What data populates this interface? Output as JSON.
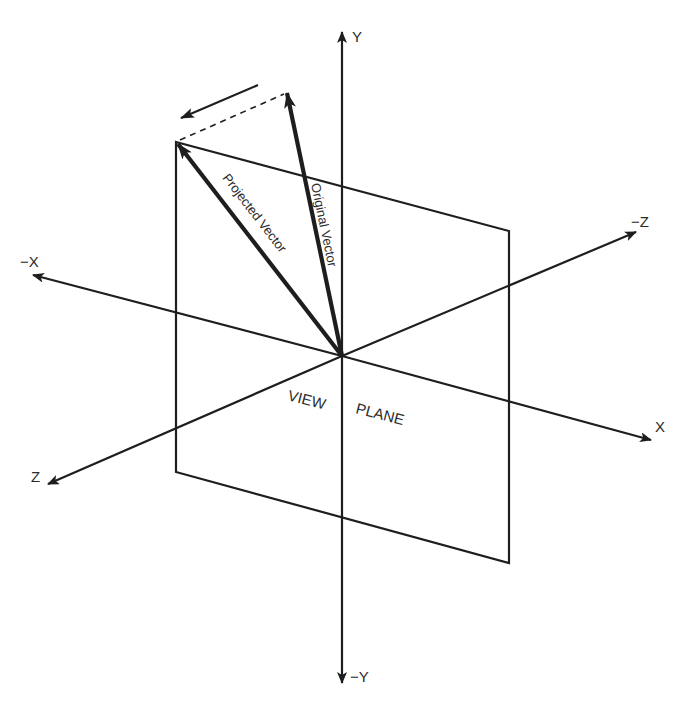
{
  "diagram": {
    "title": "",
    "colors": {
      "line": "#1e1e1e",
      "text": "#2b2b2b",
      "background": "#ffffff"
    },
    "axes": {
      "y_pos": {
        "label": "Y"
      },
      "y_neg": {
        "label": "−Y"
      },
      "x_pos": {
        "label": "X"
      },
      "x_neg": {
        "label": "−X"
      },
      "z_pos": {
        "label": "Z"
      },
      "z_neg": {
        "label": "−Z"
      }
    },
    "vectors": {
      "original": {
        "label": "Original Vector"
      },
      "projected": {
        "label": "Projected Vector"
      }
    },
    "view_plane": {
      "label_left": "VIEW",
      "label_right": "PLANE"
    },
    "annotations": {
      "projection_line": "dashed",
      "motion_arrow": "arrow pointing from original vector tip toward projected vector tip"
    }
  }
}
